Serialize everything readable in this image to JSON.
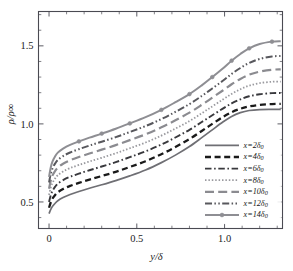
{
  "figure": {
    "background": "#ffffff",
    "frame_color": "#4a4a52"
  },
  "chart_data": {
    "type": "line",
    "title": "",
    "xlabel": "y/δ",
    "ylabel": "ρ/ρ∞",
    "xlim": [
      -0.06,
      1.33
    ],
    "ylim": [
      0.33,
      1.72
    ],
    "xticks": [
      0,
      0.5,
      1.0
    ],
    "xticklabels": [
      "0",
      "0.5",
      "1.0"
    ],
    "yticks": [
      0.5,
      1.0,
      1.5
    ],
    "yticklabels": [
      "0.5",
      "1.0",
      "1.5"
    ],
    "xminor_step": 0.1,
    "yminor_step": 0.1,
    "grid": false,
    "legend_position": "lower-right",
    "x": [
      0.0,
      0.01,
      0.02,
      0.035,
      0.05,
      0.08,
      0.12,
      0.17,
      0.23,
      0.3,
      0.38,
      0.46,
      0.55,
      0.64,
      0.72,
      0.8,
      0.87,
      0.93,
      0.99,
      1.04,
      1.09,
      1.14,
      1.2,
      1.27,
      1.32
    ],
    "series": [
      {
        "name": "x=2δ₀",
        "label_prefix": "x=",
        "label_value": "2",
        "label_suffix": "δ₀",
        "style": "solid",
        "color": "#6f6f74",
        "width": 1.7,
        "marker": "none",
        "values": [
          0.425,
          0.452,
          0.472,
          0.492,
          0.508,
          0.528,
          0.548,
          0.567,
          0.588,
          0.61,
          0.637,
          0.667,
          0.705,
          0.752,
          0.8,
          0.855,
          0.912,
          0.962,
          1.012,
          1.048,
          1.072,
          1.086,
          1.092,
          1.093,
          1.093
        ]
      },
      {
        "name": "x=4δ₀",
        "label_prefix": "x=",
        "label_value": "4",
        "label_suffix": "δ₀",
        "style": "dashed",
        "color": "#1a1a1a",
        "width": 2.3,
        "marker": "none",
        "values": [
          0.463,
          0.498,
          0.522,
          0.545,
          0.562,
          0.583,
          0.603,
          0.622,
          0.643,
          0.666,
          0.693,
          0.724,
          0.761,
          0.806,
          0.852,
          0.903,
          0.955,
          1.0,
          1.044,
          1.075,
          1.097,
          1.112,
          1.122,
          1.127,
          1.128
        ]
      },
      {
        "name": "x=6δ₀",
        "label_prefix": "x=",
        "label_value": "6",
        "label_suffix": "δ₀",
        "style": "dashdot",
        "color": "#39393d",
        "width": 1.9,
        "marker": "none",
        "values": [
          0.5,
          0.543,
          0.572,
          0.598,
          0.617,
          0.64,
          0.661,
          0.681,
          0.703,
          0.727,
          0.755,
          0.787,
          0.824,
          0.868,
          0.913,
          0.962,
          1.012,
          1.055,
          1.098,
          1.131,
          1.157,
          1.177,
          1.19,
          1.197,
          1.198
        ]
      },
      {
        "name": "x=8δ₀",
        "label_prefix": "x=",
        "label_value": "8",
        "label_suffix": "δ₀",
        "style": "dotted",
        "color": "#9a9a9f",
        "width": 1.8,
        "marker": "none",
        "values": [
          0.545,
          0.592,
          0.623,
          0.651,
          0.671,
          0.695,
          0.717,
          0.737,
          0.759,
          0.783,
          0.812,
          0.844,
          0.881,
          0.925,
          0.97,
          1.018,
          1.068,
          1.112,
          1.156,
          1.192,
          1.222,
          1.245,
          1.261,
          1.27,
          1.271
        ]
      },
      {
        "name": "x=10δ₀",
        "label_prefix": "x=",
        "label_value": "10",
        "label_suffix": "δ₀",
        "style": "longdash",
        "color": "#8b8b90",
        "width": 2.2,
        "marker": "none",
        "values": [
          0.585,
          0.637,
          0.67,
          0.699,
          0.72,
          0.745,
          0.767,
          0.788,
          0.81,
          0.835,
          0.864,
          0.896,
          0.933,
          0.978,
          1.023,
          1.072,
          1.122,
          1.168,
          1.214,
          1.254,
          1.288,
          1.315,
          1.335,
          1.347,
          1.349
        ]
      },
      {
        "name": "x=12δ₀",
        "label_prefix": "x=",
        "label_value": "12",
        "label_suffix": "δ₀",
        "style": "dashdotdot",
        "color": "#58585d",
        "width": 2.0,
        "marker": "none",
        "values": [
          0.625,
          0.681,
          0.716,
          0.747,
          0.769,
          0.794,
          0.817,
          0.838,
          0.861,
          0.886,
          0.915,
          0.948,
          0.986,
          1.031,
          1.077,
          1.127,
          1.179,
          1.227,
          1.276,
          1.32,
          1.358,
          1.39,
          1.416,
          1.432,
          1.435
        ]
      },
      {
        "name": "x=14δ₀",
        "label_prefix": "x=",
        "label_value": "14",
        "label_suffix": "δ₀",
        "style": "solid-marker",
        "color": "#8e8e93",
        "width": 2.0,
        "marker": "circle",
        "values": [
          0.66,
          0.722,
          0.76,
          0.793,
          0.816,
          0.842,
          0.866,
          0.888,
          0.912,
          0.938,
          0.969,
          1.003,
          1.043,
          1.09,
          1.139,
          1.191,
          1.247,
          1.3,
          1.355,
          1.405,
          1.448,
          1.484,
          1.512,
          1.527,
          1.53
        ]
      }
    ]
  }
}
